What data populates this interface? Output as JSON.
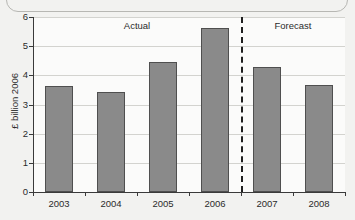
{
  "chart_data": {
    "type": "bar",
    "title": "",
    "subtitle": "",
    "xlabel": "",
    "ylabel": "£ billion 2006",
    "categories": [
      "2003",
      "2004",
      "2005",
      "2006",
      "2007",
      "2008"
    ],
    "values": [
      3.65,
      3.42,
      4.45,
      5.62,
      4.3,
      3.68
    ],
    "series": [
      {
        "name": "Expenditure",
        "values": [
          3.65,
          3.42,
          4.45,
          5.62,
          4.3,
          3.68
        ]
      }
    ],
    "ylim": [
      0,
      6
    ],
    "xlim_categories": 6,
    "ytick_labels": [
      "0",
      "1",
      "2",
      "3",
      "4",
      "5",
      "6"
    ],
    "ytick_values": [
      0,
      1,
      2,
      3,
      4,
      5,
      6
    ],
    "grid": "horizontal",
    "legend": "none",
    "bar_color": "#8a8a8a",
    "bar_edge_color": "#4f4f4f",
    "grid_color": "#d3d3cf",
    "axis_color": "#3a3a3a",
    "plot_background": "#fbfbfa",
    "figure_background": "#f2f2f0",
    "annotations": [
      {
        "name": "actual-region-label",
        "text": "Actual",
        "covers_categories": [
          "2003",
          "2004",
          "2005",
          "2006"
        ]
      },
      {
        "name": "forecast-region-label",
        "text": "Forecast",
        "covers_categories": [
          "2007",
          "2008"
        ]
      },
      {
        "name": "actual-forecast-divider",
        "text": "",
        "style": "vertical dashed line between 2006 and 2007"
      }
    ]
  }
}
